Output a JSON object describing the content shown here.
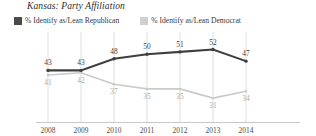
{
  "chart": {
    "title": "Kansas: Party Affiliation",
    "legend": [
      {
        "label": "% Identify as/Lean Republican",
        "color": "#4a4a4a",
        "swatch": "legend-swatch-republican"
      },
      {
        "label": "% Identify as/Lean Democrat",
        "color": "#cccccc",
        "swatch": "legend-swatch-democrat"
      }
    ]
  },
  "chart_data": {
    "type": "line",
    "title": "Kansas: Party Affiliation",
    "xlabel": "",
    "ylabel": "",
    "categories": [
      "2008",
      "2009",
      "2010",
      "2011",
      "2012",
      "2013",
      "2014"
    ],
    "series": [
      {
        "name": "% Identify as/Lean Republican",
        "color": "#3f3f3f",
        "values": [
          43,
          43,
          48,
          50,
          51,
          52,
          47
        ]
      },
      {
        "name": "% Identify as/Lean Democrat",
        "color": "#c9c9c9",
        "values": [
          41,
          42,
          37,
          35,
          35,
          31,
          34
        ]
      }
    ],
    "ylim": [
      25,
      57
    ],
    "grid": true,
    "legend_position": "top-left",
    "labels": {
      "republican": [
        "43",
        "43",
        "48",
        "50",
        "51",
        "52",
        "47"
      ],
      "democrat": [
        "41",
        "42",
        "37",
        "35",
        "35",
        "31",
        "34"
      ]
    }
  }
}
